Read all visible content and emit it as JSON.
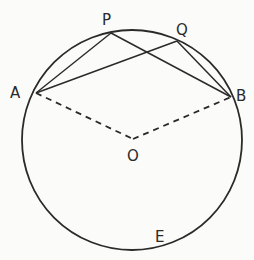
{
  "diagram": {
    "type": "circle-geometry",
    "colors": {
      "ink": "#2a2a2a",
      "background": "#fbfbfa"
    },
    "circle": {
      "center": "O",
      "cx": 132,
      "cy": 140,
      "r": 110
    },
    "points": [
      {
        "id": "A",
        "label": "A",
        "x": 36,
        "y": 93,
        "lx": 10,
        "ly": 98
      },
      {
        "id": "P",
        "label": "P",
        "x": 111,
        "y": 33,
        "lx": 102,
        "ly": 25
      },
      {
        "id": "Q",
        "label": "Q",
        "x": 177,
        "y": 41,
        "lx": 176,
        "ly": 35
      },
      {
        "id": "B",
        "label": "B",
        "x": 231,
        "y": 97,
        "lx": 236,
        "ly": 100
      },
      {
        "id": "O",
        "label": "O",
        "x": 133,
        "y": 139,
        "lx": 128,
        "ly": 160
      },
      {
        "id": "E",
        "label": "E",
        "x": 160,
        "y": 249,
        "lx": 155,
        "ly": 241
      }
    ],
    "solid_segments": [
      [
        "A",
        "P"
      ],
      [
        "A",
        "Q"
      ],
      [
        "P",
        "B"
      ],
      [
        "Q",
        "B"
      ]
    ],
    "dashed_segments": [
      [
        "A",
        "O"
      ],
      [
        "O",
        "B"
      ]
    ]
  }
}
